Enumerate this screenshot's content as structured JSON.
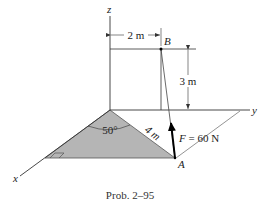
{
  "figure": {
    "caption": "Prob. 2–95",
    "axes": {
      "x": "x",
      "y": "y",
      "z": "z"
    },
    "points": {
      "A": "A",
      "B": "B"
    },
    "dimensions": {
      "horizontal": "2 m",
      "vertical": "3 m",
      "slant": "4 m",
      "angle": "50°"
    },
    "force": {
      "symbol": "F",
      "equals": " = 60 N",
      "magnitude": 60,
      "unit": "N"
    },
    "colors": {
      "shaded_plane": "#b5b5b5",
      "line": "#333333",
      "arrow": "#000000"
    }
  }
}
